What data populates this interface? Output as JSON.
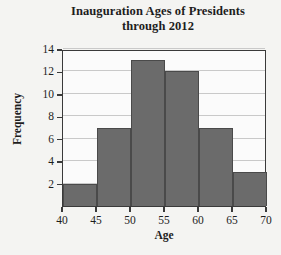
{
  "chart_data": {
    "type": "bar",
    "title": "Inauguration Ages of Presidents through 2012",
    "title_lines": [
      "Inauguration Ages of Presidents",
      "through 2012"
    ],
    "xlabel": "Age",
    "ylabel": "Frequency",
    "xlim": [
      40,
      70
    ],
    "ylim": [
      0,
      14
    ],
    "xticks": [
      40,
      45,
      50,
      55,
      60,
      65,
      70
    ],
    "yticks": [
      2,
      4,
      6,
      8,
      10,
      12,
      14
    ],
    "grid": true,
    "legend": false,
    "bin_width": 5,
    "bin_edges": [
      40,
      45,
      50,
      55,
      60,
      65,
      70
    ],
    "categories": [
      "40-45",
      "45-50",
      "50-55",
      "55-60",
      "60-65",
      "65-70"
    ],
    "values": [
      2,
      7,
      13,
      12,
      7,
      3
    ],
    "colors": {
      "bar_fill": "#6b6b6b",
      "bar_edge": "#4a4a4a",
      "grid": "#c9c9c9",
      "axis": "#3a3a3a",
      "plot_background": "#fbfbfb",
      "page_background": "#f4f4f2",
      "text": "#1d1d1d"
    }
  }
}
